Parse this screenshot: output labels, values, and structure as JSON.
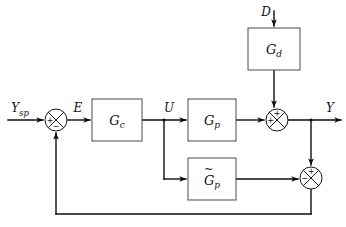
{
  "diagram": {
    "canvas": {
      "width": 346,
      "height": 227
    },
    "colors": {
      "background": "#ffffff",
      "wire": "#0d0d0d",
      "block_border": "#4a4a4a",
      "junction_border": "#1a1a1a",
      "text": "#111111"
    },
    "blocks": [
      {
        "id": "gd",
        "label": "G",
        "subscript": "d",
        "tilde": false,
        "x": 248,
        "y": 28,
        "w": 52,
        "h": 42
      },
      {
        "id": "gc",
        "label": "G",
        "subscript": "c",
        "tilde": false,
        "x": 92,
        "y": 99,
        "w": 50,
        "h": 42
      },
      {
        "id": "gp",
        "label": "G",
        "subscript": "p",
        "tilde": false,
        "x": 188,
        "y": 99,
        "w": 48,
        "h": 42
      },
      {
        "id": "gpm",
        "label": "G",
        "subscript": "p",
        "tilde": true,
        "x": 188,
        "y": 158,
        "w": 48,
        "h": 42
      }
    ],
    "junctions": [
      {
        "id": "sum-error",
        "cx": 56,
        "cy": 120,
        "r": 11,
        "signs": [
          {
            "symbol": "+",
            "position": "left"
          },
          {
            "symbol": "−",
            "position": "bottom"
          }
        ]
      },
      {
        "id": "sum-output",
        "cx": 277,
        "cy": 120,
        "r": 11,
        "signs": [
          {
            "symbol": "+",
            "position": "top"
          },
          {
            "symbol": "+",
            "position": "left"
          }
        ]
      },
      {
        "id": "sum-model-error",
        "cx": 311,
        "cy": 178,
        "r": 11,
        "signs": [
          {
            "symbol": "+",
            "position": "top"
          },
          {
            "symbol": "−",
            "position": "left"
          }
        ]
      }
    ],
    "signals": [
      {
        "id": "ysp",
        "label": "Y",
        "subscript": "sp",
        "x": 20,
        "y": 112
      },
      {
        "id": "e",
        "label": "E",
        "subscript": "",
        "x": 76,
        "y": 112
      },
      {
        "id": "u",
        "label": "U",
        "subscript": "",
        "x": 169,
        "y": 112
      },
      {
        "id": "d",
        "label": "D",
        "subscript": "",
        "x": 272,
        "y": 16
      },
      {
        "id": "y",
        "label": "Y",
        "subscript": "",
        "x": 330,
        "y": 112
      }
    ]
  }
}
